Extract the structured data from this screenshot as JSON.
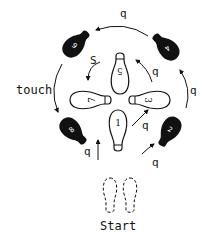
{
  "diagram": {
    "type": "dance-step-footprint-diagram",
    "start_label": "Start",
    "touch_label": "touch",
    "colors": {
      "ink": "#111111",
      "background": "#ffffff"
    },
    "inner_steps": [
      {
        "number": "1",
        "foot": "right",
        "style": "outline",
        "position": "bottom"
      },
      {
        "number": "3",
        "foot": "right",
        "style": "outline",
        "position": "right"
      },
      {
        "number": "5",
        "foot": "right",
        "style": "outline",
        "position": "top"
      },
      {
        "number": "7",
        "foot": "right",
        "style": "outline",
        "position": "left"
      }
    ],
    "outer_steps": [
      {
        "number": "2",
        "foot": "left",
        "style": "filled",
        "position": "bottom-right"
      },
      {
        "number": "4",
        "foot": "left",
        "style": "filled",
        "position": "top-right"
      },
      {
        "number": "6",
        "foot": "left",
        "style": "filled",
        "position": "top-left"
      },
      {
        "number": "8",
        "foot": "left",
        "style": "filled",
        "position": "bottom-left"
      }
    ],
    "timing_labels": [
      {
        "id": "start-to-1",
        "text": "q"
      },
      {
        "id": "start-to-2",
        "text": "q"
      },
      {
        "id": "1-to-3",
        "text": "q"
      },
      {
        "id": "2-to-4",
        "text": "q"
      },
      {
        "id": "3-to-5",
        "text": "q"
      },
      {
        "id": "4-to-6",
        "text": "q"
      },
      {
        "id": "5-to-7",
        "text": "S"
      },
      {
        "id": "6-to-8",
        "text": "touch"
      }
    ]
  }
}
